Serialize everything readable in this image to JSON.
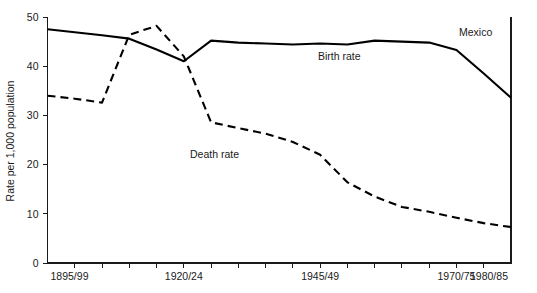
{
  "chart_data": {
    "type": "line",
    "title": "",
    "subtitle": "",
    "xlabel": "",
    "ylabel": "Rate per 1,000 population",
    "ylim": [
      0,
      50
    ],
    "yticks": [
      0,
      10,
      20,
      30,
      40,
      50
    ],
    "ytick_labels": [
      "0",
      "10",
      "20",
      "30",
      "40",
      "50"
    ],
    "grid": false,
    "legend_position": "inline-annotations",
    "x": [
      "1895/99",
      "1900/04",
      "1905/09",
      "1910/14",
      "1915/19",
      "1920/24",
      "1925/29",
      "1930/34",
      "1935/39",
      "1940/44",
      "1945/49",
      "1950/54",
      "1955/59",
      "1960/64",
      "1965/69",
      "1970/75",
      "1975/79",
      "1980/85"
    ],
    "xtick_labels": [
      "1895/99",
      "",
      "",
      "",
      "",
      "1920/24",
      "",
      "",
      "",
      "",
      "1945/49",
      "",
      "",
      "",
      "",
      "1970/75",
      "",
      "1980/85"
    ],
    "series": [
      {
        "name": "Birth rate",
        "style": "solid",
        "color": "#000000",
        "values": [
          47.5,
          46.9,
          46.3,
          45.6,
          43.4,
          41.0,
          45.2,
          44.8,
          44.6,
          44.4,
          44.6,
          44.4,
          45.2,
          45.0,
          44.8,
          43.3,
          38.5,
          33.6
        ]
      },
      {
        "name": "Death rate",
        "style": "dashed",
        "color": "#000000",
        "values": [
          34.0,
          33.4,
          32.6,
          46.4,
          48.2,
          42.0,
          28.6,
          27.4,
          26.3,
          24.6,
          22.0,
          16.4,
          13.5,
          11.4,
          10.4,
          9.2,
          8.1,
          7.3
        ]
      }
    ],
    "annotations": [
      {
        "name": "country-label",
        "text": "Mexico",
        "x_px": 459,
        "y_px": 36
      },
      {
        "name": "birth-rate-label",
        "text": "Birth rate",
        "x_px": 318,
        "y_px": 60
      },
      {
        "name": "death-rate-label",
        "text": "Death rate",
        "x_px": 190,
        "y_px": 158
      }
    ]
  },
  "axes": {
    "y_axis_title": "Rate per 1,000 population"
  }
}
